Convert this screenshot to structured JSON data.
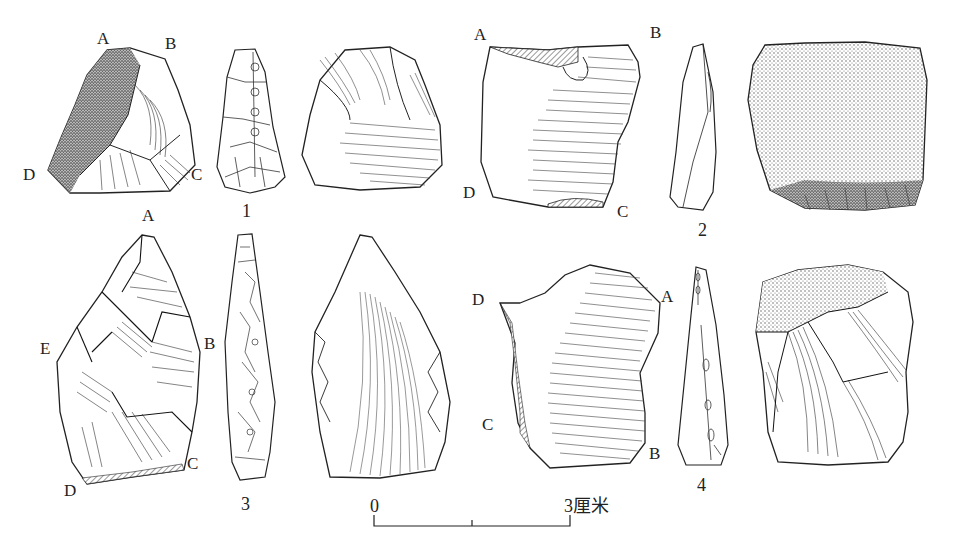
{
  "figure": {
    "artifacts": [
      {
        "number": "1",
        "points": [
          "A",
          "B",
          "C",
          "D"
        ]
      },
      {
        "number": "2",
        "points": [
          "A",
          "B",
          "C",
          "D"
        ]
      },
      {
        "number": "3",
        "points": [
          "A",
          "B",
          "C",
          "D",
          "E"
        ]
      },
      {
        "number": "4",
        "points": [
          "A",
          "B",
          "C",
          "D"
        ]
      }
    ],
    "scale_bar": {
      "start": "0",
      "end": "3厘米"
    }
  }
}
